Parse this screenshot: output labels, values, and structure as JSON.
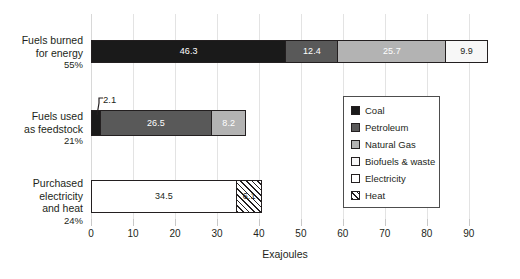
{
  "chart_data": {
    "type": "bar",
    "orientation": "horizontal",
    "stacked": true,
    "title": "",
    "xlabel": "Exajoules",
    "ylabel": "",
    "xlim": [
      0,
      96
    ],
    "xticks": [
      0,
      10,
      20,
      30,
      40,
      50,
      60,
      70,
      80,
      90
    ],
    "xtick_labels": [
      "0",
      "10",
      "20",
      "30",
      "40",
      "50",
      "60",
      "70",
      "80",
      "90"
    ],
    "grid": true,
    "legend_position": "inside-right",
    "categories": [
      {
        "label_lines": [
          "Fuels burned",
          "for energy"
        ],
        "percent": "55%",
        "segments": [
          {
            "series": "Coal",
            "value": 46.3,
            "label": "46.3",
            "label_color": "light",
            "fill": "coal"
          },
          {
            "series": "Petroleum",
            "value": 12.4,
            "label": "12.4",
            "label_color": "light",
            "fill": "petroleum"
          },
          {
            "series": "Natural Gas",
            "value": 25.7,
            "label": "25.7",
            "label_color": "light",
            "fill": "naturalgas"
          },
          {
            "series": "Biofuels & waste",
            "value": 9.9,
            "label": "9.9",
            "label_color": "dark",
            "fill": "biofuels"
          }
        ]
      },
      {
        "label_lines": [
          "Fuels used",
          "as feedstock"
        ],
        "percent": "21%",
        "segments": [
          {
            "series": "Coal",
            "value": 2.1,
            "label": "",
            "label_color": "light",
            "fill": "coal"
          },
          {
            "series": "Petroleum",
            "value": 26.5,
            "label": "26.5",
            "label_color": "light",
            "fill": "petroleum"
          },
          {
            "series": "Natural Gas",
            "value": 8.2,
            "label": "8.2",
            "label_color": "light",
            "fill": "naturalgas"
          }
        ]
      },
      {
        "label_lines": [
          "Purchased",
          "electricity",
          "and heat"
        ],
        "percent": "24%",
        "segments": [
          {
            "series": "Electricity",
            "value": 34.5,
            "label": "34.5",
            "label_color": "dark",
            "fill": "electricity"
          },
          {
            "series": "Heat",
            "value": 6.1,
            "label": "6.1",
            "label_color": "dark",
            "fill": "heat"
          }
        ]
      }
    ],
    "annotations": [
      {
        "name": "callout-2-1",
        "text": "2.1",
        "points_to": "Coal segment of Fuels used as feedstock"
      }
    ],
    "legend": [
      {
        "label": "Coal",
        "fill": "coal",
        "color": "#1a1a1a"
      },
      {
        "label": "Petroleum",
        "fill": "petroleum",
        "color": "#595959"
      },
      {
        "label": "Natural Gas",
        "fill": "naturalgas",
        "color": "#b3b3b3"
      },
      {
        "label": "Biofuels & waste",
        "fill": "biofuels",
        "color": "#ffffff"
      },
      {
        "label": "Electricity",
        "fill": "electricity",
        "color": "#ffffff"
      },
      {
        "label": "Heat",
        "fill": "heat",
        "color": "#ffffff"
      }
    ]
  },
  "axis": {
    "title": "Exajoules"
  },
  "rows": {
    "r0": {
      "line1": "Fuels burned",
      "line2": "for energy",
      "line3": "",
      "pct": "55%"
    },
    "r1": {
      "line1": "Fuels used",
      "line2": "as feedstock",
      "line3": "",
      "pct": "21%"
    },
    "r2": {
      "line1": "Purchased",
      "line2": "electricity",
      "line3": "and heat",
      "pct": "24%"
    }
  },
  "callout": {
    "value": "2.1"
  }
}
